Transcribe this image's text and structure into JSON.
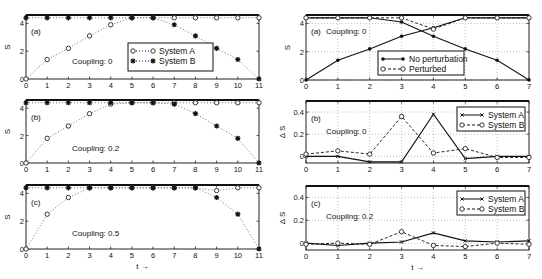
{
  "chart_data": [
    {
      "panel": "left-a",
      "type": "line",
      "label": "(a)",
      "annotation": "Coupling: 0",
      "xlabel": "",
      "ylabel": "S",
      "x": [
        0,
        1,
        2,
        3,
        4,
        5,
        6,
        7,
        8,
        9,
        10,
        11
      ],
      "xticks": [
        0,
        1,
        2,
        3,
        4,
        5,
        6,
        7,
        8,
        9,
        10,
        11
      ],
      "yticks": [
        0,
        2,
        4
      ],
      "xlim": [
        0,
        11
      ],
      "ylim": [
        0,
        4.6
      ],
      "legend": [
        "System A",
        "System B"
      ],
      "legend_position": "lower right (center)",
      "series": [
        {
          "name": "System A",
          "marker": "circle",
          "style": "dotted",
          "values": [
            0,
            1.4,
            2.2,
            3.1,
            3.9,
            4.4,
            4.4,
            4.4,
            4.4,
            4.4,
            4.4,
            4.4
          ]
        },
        {
          "name": "System B",
          "marker": "star",
          "style": "dotted",
          "values": [
            4.4,
            4.4,
            4.4,
            4.4,
            4.4,
            4.4,
            4.4,
            3.9,
            3.1,
            2.2,
            1.4,
            0
          ]
        }
      ]
    },
    {
      "panel": "left-b",
      "type": "line",
      "label": "(b)",
      "annotation": "Coupling: 0.2",
      "ylabel": "S",
      "x": [
        0,
        1,
        2,
        3,
        4,
        5,
        6,
        7,
        8,
        9,
        10,
        11
      ],
      "xticks": [
        0,
        1,
        2,
        3,
        4,
        5,
        6,
        7,
        8,
        9,
        10,
        11
      ],
      "yticks": [
        0,
        2,
        4
      ],
      "xlim": [
        0,
        11
      ],
      "ylim": [
        0,
        4.6
      ],
      "series": [
        {
          "name": "System A",
          "marker": "circle",
          "style": "dotted",
          "values": [
            0,
            1.8,
            2.7,
            3.6,
            4.3,
            4.4,
            4.4,
            4.4,
            4.4,
            4.4,
            4.4,
            4.4
          ]
        },
        {
          "name": "System B",
          "marker": "star",
          "style": "dotted",
          "values": [
            4.4,
            4.4,
            4.4,
            4.4,
            4.4,
            4.4,
            4.4,
            4.3,
            3.6,
            2.7,
            1.8,
            0
          ]
        }
      ]
    },
    {
      "panel": "left-c",
      "type": "line",
      "label": "(c)",
      "annotation": "Coupling: 0.5",
      "xlabel": "t →",
      "ylabel": "S",
      "x": [
        0,
        1,
        2,
        3,
        4,
        5,
        6,
        7,
        8,
        9,
        10,
        11
      ],
      "xticks": [
        0,
        1,
        2,
        3,
        4,
        5,
        6,
        7,
        8,
        9,
        10,
        11
      ],
      "yticks": [
        0,
        2,
        4
      ],
      "xlim": [
        0,
        11
      ],
      "ylim": [
        0,
        4.6
      ],
      "series": [
        {
          "name": "System A",
          "marker": "circle",
          "style": "dotted",
          "values": [
            0,
            2.5,
            3.7,
            4.4,
            4.4,
            4.4,
            4.4,
            4.4,
            4.4,
            4.2,
            4.4,
            4.4
          ]
        },
        {
          "name": "System B",
          "marker": "star",
          "style": "dotted",
          "values": [
            4.4,
            4.4,
            4.4,
            4.4,
            4.4,
            4.4,
            4.4,
            4.4,
            4.4,
            3.7,
            2.5,
            0
          ]
        }
      ]
    },
    {
      "panel": "right-a",
      "type": "line",
      "label": "(a)",
      "annotation": "Coupling: 0",
      "ylabel": "S",
      "x": [
        0,
        1,
        2,
        3,
        4,
        5,
        6,
        7
      ],
      "xticks": [
        0,
        1,
        2,
        3,
        4,
        5,
        6,
        7
      ],
      "yticks": [
        0,
        2,
        4
      ],
      "xlim": [
        0,
        7
      ],
      "ylim": [
        0,
        4.6
      ],
      "grid": true,
      "legend": [
        "No perturbation",
        "Perturbed"
      ],
      "legend_position": "lower center",
      "series": [
        {
          "name": "No perturbation (rising)",
          "marker": "dot",
          "style": "solid",
          "values": [
            0,
            1.4,
            2.2,
            3.1,
            3.7,
            4.4,
            4.4,
            4.4
          ]
        },
        {
          "name": "No perturbation (falling)",
          "marker": "dot",
          "style": "solid",
          "values": [
            4.4,
            4.4,
            4.4,
            4.1,
            3.1,
            2.2,
            1.4,
            0
          ]
        },
        {
          "name": "Perturbed",
          "marker": "circle",
          "style": "dashed",
          "values": [
            4.4,
            4.4,
            4.4,
            4.4,
            3.6,
            4.4,
            4.4,
            4.4
          ]
        }
      ]
    },
    {
      "panel": "right-b",
      "type": "line",
      "label": "(b)",
      "annotation": "Coupling: 0",
      "ylabel": "Δ S",
      "x": [
        0,
        1,
        2,
        3,
        4,
        5,
        6,
        7
      ],
      "xticks": [
        0,
        1,
        2,
        3,
        4,
        5,
        6,
        7
      ],
      "yticks": [
        0,
        0.2,
        0.4
      ],
      "xlim": [
        0,
        7
      ],
      "ylim": [
        -0.06,
        0.5
      ],
      "grid": true,
      "legend": [
        "System A",
        "System B"
      ],
      "legend_position": "upper right",
      "series": [
        {
          "name": "System A",
          "marker": "x",
          "style": "solid",
          "values": [
            0,
            0,
            -0.05,
            -0.05,
            0.38,
            -0.02,
            0,
            0
          ]
        },
        {
          "name": "System B",
          "marker": "circle",
          "style": "dashed",
          "values": [
            0.02,
            0.05,
            0.02,
            0.36,
            0.03,
            0.07,
            -0.01,
            -0.01
          ]
        }
      ]
    },
    {
      "panel": "right-c",
      "type": "line",
      "label": "(c)",
      "annotation": "Coupling: 0.2",
      "xlabel": "t →",
      "ylabel": "Δ S",
      "x": [
        0,
        1,
        2,
        3,
        4,
        5,
        6,
        7
      ],
      "xticks": [
        0,
        1,
        2,
        3,
        4,
        5,
        6,
        7
      ],
      "yticks": [
        0,
        0.2,
        0.4
      ],
      "xlim": [
        0,
        7
      ],
      "ylim": [
        -0.06,
        0.5
      ],
      "grid": true,
      "legend": [
        "System A",
        "System B"
      ],
      "legend_position": "upper right",
      "series": [
        {
          "name": "System A",
          "marker": "x",
          "style": "solid",
          "values": [
            0,
            -0.02,
            0,
            0.01,
            0.09,
            0.02,
            0.01,
            0.02
          ]
        },
        {
          "name": "System B",
          "marker": "circle",
          "style": "dashed",
          "values": [
            -0.01,
            0,
            -0.01,
            0.1,
            -0.02,
            -0.03,
            0,
            -0.01
          ]
        }
      ]
    }
  ],
  "labels": {
    "ylabel_s": "S",
    "ylabel_ds": "Δ S",
    "xlabel": "t →"
  }
}
